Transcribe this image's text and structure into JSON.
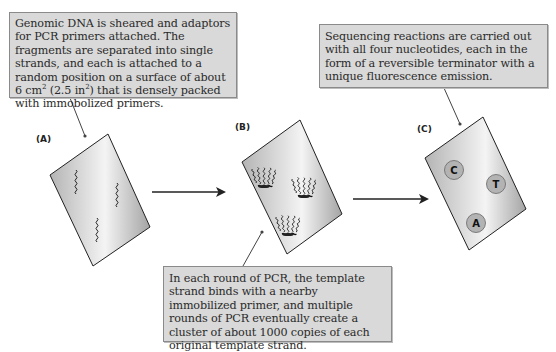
{
  "callouts": {
    "a": {
      "text": "Genomic DNA is sheared and adaptors for PCR primers attached. The fragments are separated into single strands, and each is attached to a random position on a surface of about 6 cm",
      "sup1": "2",
      "mid": " (2.5 in",
      "sup2": "2",
      "end": ") that is densely packed with immobolized primers."
    },
    "b": {
      "text": "In each round of PCR, the template strand binds with a nearby immobilized primer, and multiple rounds of PCR eventually create a cluster of about 1000 copies of each original template strand."
    },
    "c": {
      "text": "Sequencing reactions are carried out with all four nucleotides, each in the form of a reversible terminator with a unique fluorescence emission."
    }
  },
  "panels": {
    "a": {
      "label": "(A)",
      "content": "three single DNA strands on flow cell"
    },
    "b": {
      "label": "(B)",
      "content": "three amplified DNA clusters on flow cell"
    },
    "c": {
      "label": "(C)",
      "nucleotides": [
        {
          "base": "C"
        },
        {
          "base": "T"
        },
        {
          "base": "A"
        }
      ]
    }
  },
  "colors": {
    "callout_fill": "#d9d9d9",
    "callout_border": "#8a8a8a",
    "slide_light": "#f2f2f2",
    "slide_dark": "#a6a6a6",
    "circle_fill": "#b3b3b3",
    "line": "#222222"
  }
}
